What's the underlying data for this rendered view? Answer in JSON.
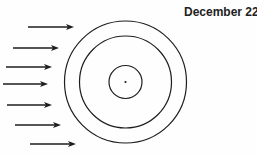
{
  "diagram": {
    "label": "December 22",
    "colors": {
      "line": "#1e1e1e",
      "text": "#222222",
      "background": "#fefefe"
    },
    "rings": [
      {
        "name": "outer-ring",
        "cx": 125.5,
        "cy": 82,
        "r": 61
      },
      {
        "name": "middle-ring",
        "cx": 125.5,
        "cy": 82,
        "r": 46
      },
      {
        "name": "inner-ring",
        "cx": 125.5,
        "cy": 82,
        "r": 16.5
      }
    ],
    "center_dot": {
      "cx": 125.5,
      "cy": 82,
      "r": 1.1
    },
    "arrows": [
      {
        "x1": 28,
        "x2": 74,
        "y": 27
      },
      {
        "x1": 13,
        "x2": 59,
        "y": 48
      },
      {
        "x1": 6,
        "x2": 52,
        "y": 67
      },
      {
        "x1": 3,
        "x2": 48,
        "y": 84
      },
      {
        "x1": 7,
        "x2": 52,
        "y": 105
      },
      {
        "x1": 15,
        "x2": 61,
        "y": 125
      },
      {
        "x1": 30,
        "x2": 76,
        "y": 144
      }
    ]
  }
}
